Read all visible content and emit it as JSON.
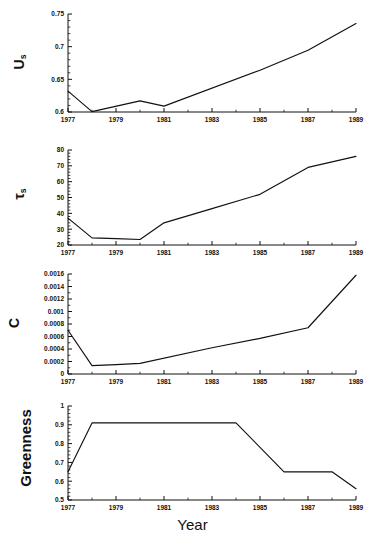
{
  "figure": {
    "xlabel": "Year",
    "x_ticks": [
      "1977",
      "1979",
      "1981",
      "1983",
      "1985",
      "1987",
      "1989"
    ],
    "x_tick_values": [
      1977,
      1979,
      1981,
      1983,
      1985,
      1987,
      1989
    ],
    "xlim": [
      1977,
      1989
    ],
    "line_color": "#111111",
    "axis_color": "#111111",
    "background": "#ffffff"
  },
  "chart_data": [
    {
      "type": "line",
      "title": "",
      "panel_index": 0,
      "ylabel": "U",
      "ylabel_sub": "s",
      "xlabel": "",
      "xlim": [
        1977,
        1989
      ],
      "ylim": [
        0.6,
        0.75
      ],
      "grid": false,
      "legend": "none",
      "y_ticks": [
        0.6,
        0.65,
        0.7,
        0.75
      ],
      "y_tick_labels": [
        "0.6",
        "0.65",
        "0.7",
        "0.75"
      ],
      "x_ticks": [
        1977,
        1979,
        1981,
        1983,
        1985,
        1987,
        1989
      ],
      "x_tick_labels": [
        "1977",
        "1979",
        "1981",
        "1983",
        "1985",
        "1987",
        "1989"
      ],
      "x": [
        1977,
        1978,
        1980,
        1981,
        1985,
        1987,
        1989
      ],
      "values": [
        0.632,
        0.6005,
        0.617,
        0.609,
        0.664,
        0.6945,
        0.7355
      ]
    },
    {
      "type": "line",
      "title": "",
      "panel_index": 1,
      "ylabel": "τ",
      "ylabel_sub": "s",
      "xlabel": "",
      "xlim": [
        1977,
        1989
      ],
      "ylim": [
        20,
        80
      ],
      "grid": false,
      "legend": "none",
      "y_ticks": [
        20,
        30,
        40,
        50,
        60,
        70,
        80
      ],
      "y_tick_labels": [
        "20",
        "30",
        "40",
        "50",
        "60",
        "70",
        "80"
      ],
      "x_ticks": [
        1977,
        1979,
        1981,
        1983,
        1985,
        1987,
        1989
      ],
      "x_tick_labels": [
        "1977",
        "1979",
        "1981",
        "1983",
        "1985",
        "1987",
        "1989"
      ],
      "x": [
        1977,
        1978,
        1979,
        1980,
        1981,
        1983,
        1985,
        1987,
        1989
      ],
      "values": [
        37,
        24.5,
        24,
        23.5,
        34,
        43,
        52,
        69,
        76
      ]
    },
    {
      "type": "line",
      "title": "",
      "panel_index": 2,
      "ylabel": "C",
      "ylabel_sub": "",
      "xlabel": "",
      "xlim": [
        1977,
        1989
      ],
      "ylim": [
        0,
        0.0016
      ],
      "grid": false,
      "legend": "none",
      "y_ticks": [
        0,
        0.0002,
        0.0004,
        0.0006,
        0.0008,
        0.001,
        0.0012,
        0.0014,
        0.0016
      ],
      "y_tick_labels": [
        "0",
        "0.0002",
        "0.0004",
        "0.0006",
        "0.0008",
        "0.001",
        "0.0012",
        "0.0014",
        "0.0016"
      ],
      "x_ticks": [
        1977,
        1979,
        1981,
        1983,
        1985,
        1987,
        1989
      ],
      "x_tick_labels": [
        "1977",
        "1979",
        "1981",
        "1983",
        "1985",
        "1987",
        "1989"
      ],
      "x": [
        1977,
        1978,
        1979,
        1980,
        1983,
        1985,
        1987,
        1989
      ],
      "values": [
        0.0007,
        0.000135,
        0.00015,
        0.00017,
        0.00042,
        0.00057,
        0.00074,
        0.00158
      ]
    },
    {
      "type": "line",
      "title": "",
      "panel_index": 3,
      "ylabel": "Greenness",
      "ylabel_sub": "",
      "xlabel": "Year",
      "xlim": [
        1977,
        1989
      ],
      "ylim": [
        0.5,
        1.0
      ],
      "grid": false,
      "legend": "none",
      "y_ticks": [
        0.5,
        0.6,
        0.7,
        0.8,
        0.9,
        1.0
      ],
      "y_tick_labels": [
        "0.5",
        "0.6",
        "0.7",
        "0.8",
        "0.9",
        "1"
      ],
      "x_ticks": [
        1977,
        1979,
        1981,
        1983,
        1985,
        1987,
        1989
      ],
      "x_tick_labels": [
        "1977",
        "1979",
        "1981",
        "1983",
        "1985",
        "1987",
        "1989"
      ],
      "x": [
        1977,
        1978,
        1984,
        1986,
        1988,
        1989
      ],
      "values": [
        0.65,
        0.91,
        0.91,
        0.65,
        0.65,
        0.56
      ]
    }
  ]
}
